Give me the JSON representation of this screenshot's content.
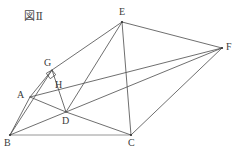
{
  "figure": {
    "title": "図Ⅱ",
    "canvas": {
      "width": 239,
      "height": 151
    },
    "stroke_color": "#4a4a4a",
    "base_stroke_color": "#8a8a8a",
    "label_color": "#3b3b3b",
    "background_color": "#ffffff",
    "points": [
      {
        "id": "A",
        "label": "A",
        "x": 30,
        "y": 97,
        "label_x": 17,
        "label_y": 90
      },
      {
        "id": "B",
        "label": "B",
        "x": 10,
        "y": 135,
        "label_x": 4,
        "label_y": 138
      },
      {
        "id": "C",
        "label": "C",
        "x": 131,
        "y": 135,
        "label_x": 128,
        "label_y": 138
      },
      {
        "id": "D",
        "label": "D",
        "x": 66,
        "y": 112,
        "label_x": 62,
        "label_y": 116
      },
      {
        "id": "E",
        "label": "E",
        "x": 122,
        "y": 22,
        "label_x": 119,
        "label_y": 7
      },
      {
        "id": "F",
        "label": "F",
        "x": 222,
        "y": 48,
        "label_x": 226,
        "label_y": 42
      },
      {
        "id": "G",
        "label": "G",
        "x": 52,
        "y": 70,
        "label_x": 44,
        "label_y": 58
      },
      {
        "id": "H",
        "label": "H",
        "x": 60,
        "y": 79,
        "label_x": 55,
        "label_y": 80
      }
    ],
    "segments": [
      {
        "name": "segment-BC",
        "from": "B",
        "to": "C",
        "style": "base"
      },
      {
        "name": "segment-BA",
        "from": "B",
        "to": "A",
        "style": "normal"
      },
      {
        "name": "segment-BG",
        "from": "B",
        "to": "G",
        "style": "normal"
      },
      {
        "name": "segment-BF",
        "from": "B",
        "to": "F",
        "style": "normal"
      },
      {
        "name": "segment-AD",
        "from": "A",
        "to": "D",
        "style": "normal"
      },
      {
        "name": "segment-AG",
        "from": "A",
        "to": "G",
        "style": "normal"
      },
      {
        "name": "segment-AF",
        "from": "A",
        "to": "F",
        "style": "normal"
      },
      {
        "name": "segment-GD",
        "from": "G",
        "to": "D",
        "style": "normal"
      },
      {
        "name": "segment-DE",
        "from": "D",
        "to": "E",
        "style": "normal"
      },
      {
        "name": "segment-DC",
        "from": "D",
        "to": "C",
        "style": "normal"
      },
      {
        "name": "segment-GE",
        "from": "G",
        "to": "E",
        "style": "normal"
      },
      {
        "name": "segment-CE",
        "from": "C",
        "to": "E",
        "style": "normal"
      },
      {
        "name": "segment-CF",
        "from": "C",
        "to": "F",
        "style": "normal"
      },
      {
        "name": "segment-EF",
        "from": "E",
        "to": "F",
        "style": "normal"
      }
    ],
    "right_angle": {
      "name": "right-angle-mark-at-G",
      "at": "G",
      "size": 6
    },
    "vertex_dots": [
      "B",
      "C",
      "E",
      "F"
    ]
  }
}
